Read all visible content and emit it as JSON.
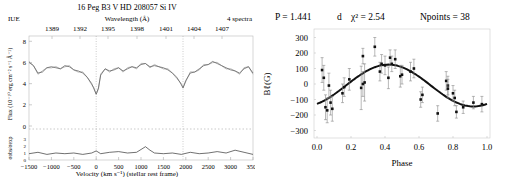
{
  "chart_data": [
    {
      "type": "line",
      "title": "16 Peg  B3 V  HD  208057  Si IV",
      "top_left_label": "IUE",
      "top_right_label": "4 spectra",
      "top_axis": {
        "label": "Wavelength (Å)",
        "ticks": [
          "1389",
          "1392",
          "1395",
          "1398",
          "1401",
          "1404",
          "1407"
        ]
      },
      "xlabel": "Velocity (km s⁻¹)  (stellar rest frame)",
      "x_ticks": [
        "−1500",
        "−1000",
        "−500",
        "0",
        "500",
        "1000",
        "1500",
        "2000",
        "2500",
        "3000",
        "3500"
      ],
      "xlim": [
        -1500,
        3500
      ],
      "upper_panel": {
        "ylabel": "Flux (10⁻¹⁰ erg cm⁻² s⁻¹ Å⁻¹)",
        "y_ticks": [
          "0",
          "2",
          "4",
          "6",
          "8"
        ],
        "ylim": [
          0,
          8.5
        ],
        "reference_lines_velocity": [
          0,
          1938
        ],
        "series": [
          {
            "name": "mean flux",
            "x": [
              -1500,
              -1400,
              -1300,
              -1200,
              -1100,
              -1000,
              -900,
              -800,
              -700,
              -600,
              -500,
              -400,
              -300,
              -200,
              -100,
              -50,
              0,
              50,
              100,
              200,
              300,
              400,
              500,
              600,
              700,
              800,
              900,
              1000,
              1100,
              1200,
              1300,
              1400,
              1500,
              1600,
              1700,
              1800,
              1900,
              1938,
              2000,
              2100,
              2200,
              2300,
              2400,
              2500,
              2600,
              2700,
              2800,
              2900,
              3000,
              3100,
              3200,
              3300,
              3400,
              3500
            ],
            "values": [
              6.0,
              5.7,
              5.0,
              5.1,
              5.5,
              5.6,
              5.5,
              5.4,
              5.7,
              5.6,
              5.3,
              5.2,
              5.0,
              4.6,
              4.0,
              3.5,
              3.0,
              3.6,
              4.8,
              5.4,
              5.2,
              5.3,
              5.5,
              5.2,
              5.4,
              5.6,
              5.5,
              5.8,
              5.9,
              5.6,
              5.7,
              5.6,
              5.5,
              5.3,
              5.0,
              4.6,
              3.9,
              3.6,
              4.3,
              5.0,
              5.1,
              5.4,
              5.7,
              5.8,
              6.1,
              5.9,
              5.7,
              5.5,
              5.3,
              5.2,
              5.0,
              5.4,
              5.6,
              5.0
            ]
          }
        ]
      },
      "lower_panel": {
        "ylabel": "σobs/σexp",
        "y_ticks": [
          "0",
          "1",
          "2",
          "3"
        ],
        "ylim": [
          0,
          4
        ],
        "series": [
          {
            "name": "sigma ratio",
            "x": [
              -1500,
              -1300,
              -1100,
              -900,
              -700,
              -500,
              -300,
              -100,
              0,
              100,
              300,
              500,
              700,
              900,
              1000,
              1100,
              1200,
              1300,
              1500,
              1700,
              1900,
              2100,
              2300,
              2500,
              2700,
              2900,
              3100,
              3300,
              3500
            ],
            "values": [
              0.9,
              1.1,
              0.8,
              1.0,
              0.9,
              1.0,
              0.8,
              1.0,
              1.3,
              0.9,
              1.1,
              1.2,
              1.0,
              1.1,
              1.5,
              1.9,
              1.4,
              1.0,
              0.9,
              1.0,
              0.8,
              1.1,
              0.9,
              1.0,
              1.2,
              1.0,
              1.4,
              1.1,
              0.8
            ]
          }
        ]
      }
    },
    {
      "type": "scatter",
      "title": "P = 1.441   d   χ² = 2.54      Npoints = 38",
      "title_parts": {
        "period": "P = 1.441",
        "unit": "d",
        "chi2": "χ² = 2.54",
        "npoints": "Npoints = 38"
      },
      "xlabel": "Phase",
      "ylabel": "Bℓ(G)",
      "xlim": [
        0.0,
        1.0
      ],
      "ylim": [
        -350,
        350
      ],
      "x_ticks": [
        "0.0",
        "0.2",
        "0.4",
        "0.6",
        "0.8",
        "1.0"
      ],
      "y_ticks": [
        "300",
        "200",
        "100",
        "0",
        "−100",
        "−200",
        "−300"
      ],
      "grid": false,
      "points": {
        "phase": [
          0.03,
          0.04,
          0.05,
          0.06,
          0.07,
          0.08,
          0.09,
          0.15,
          0.16,
          0.19,
          0.26,
          0.27,
          0.28,
          0.27,
          0.34,
          0.37,
          0.38,
          0.4,
          0.42,
          0.43,
          0.44,
          0.46,
          0.49,
          0.5,
          0.55,
          0.57,
          0.61,
          0.62,
          0.71,
          0.76,
          0.77,
          0.77,
          0.8,
          0.81,
          0.82,
          0.86,
          0.92,
          0.97
        ],
        "B": [
          90,
          40,
          -150,
          -170,
          -10,
          -120,
          -160,
          -60,
          -20,
          30,
          -25,
          180,
          10,
          0,
          240,
          80,
          130,
          120,
          40,
          170,
          130,
          160,
          50,
          60,
          80,
          100,
          -100,
          -70,
          -190,
          20,
          -10,
          -30,
          -60,
          -90,
          -180,
          -150,
          -120,
          -130
        ],
        "err": [
          80,
          80,
          80,
          80,
          80,
          80,
          80,
          60,
          60,
          70,
          140,
          50,
          120,
          80,
          60,
          60,
          60,
          60,
          70,
          50,
          50,
          60,
          70,
          60,
          60,
          60,
          50,
          50,
          50,
          60,
          60,
          60,
          50,
          50,
          40,
          40,
          40,
          50
        ]
      },
      "fit_curve": {
        "model": "B0 + B1*sin(2pi(phase+phi))",
        "B0": -10,
        "B1": 135,
        "peak_phase": 0.42
      }
    }
  ]
}
